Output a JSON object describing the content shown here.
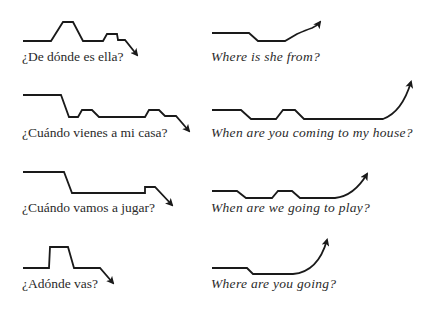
{
  "colors": {
    "line": "#1a1a1a",
    "text": "#2a2a2a",
    "background": "#ffffff"
  },
  "pairs": [
    {
      "spanish": {
        "text": "¿De dónde es ella?",
        "contour": "23,41 51,41 63,22 73,22 83,41 103,41 107,34 117,34 118,40 125,40",
        "arrow_end": "137,55",
        "arrow_dir": "down"
      },
      "english": {
        "text": "Where is she from?",
        "contour": "212,33 249,33 258,41 285,41 297,34 312,28",
        "arrow_end": "320,22",
        "arrow_dir": "up"
      }
    },
    {
      "spanish": {
        "text": "¿Cuándo vienes a mi casa?",
        "contour": "23,95 61,95 69,117 78,117 82,110 92,110 99,117 145,117 149,110 159,110 165,116 176,116",
        "arrow_end": "189,131",
        "arrow_dir": "down"
      },
      "english": {
        "text": "When are you coming to my house?",
        "contour": "212,110 241,110 251,119 276,119 283,110 295,110 304,119 383,119",
        "arrow_end": "411,82",
        "arrow_dir": "up"
      }
    },
    {
      "spanish": {
        "text": "¿Cuándo vamos a jugar?",
        "contour": "23,172 64,172 72,193 145,193 145,187 155,187",
        "arrow_end": "172,205",
        "arrow_dir": "down"
      },
      "english": {
        "text": "When are we going to play?",
        "contour": "212,191 237,191 246,198 272,198 278,191 292,191 300,198 335,198",
        "arrow_end": "367,174",
        "arrow_dir": "up"
      }
    },
    {
      "spanish": {
        "text": "¿Adónde vas?",
        "contour": "23,268 49,268 50,247 68,247 74,268 100,268",
        "arrow_end": "113,283",
        "arrow_dir": "down"
      },
      "english": {
        "text": "Where are you going?",
        "contour": "212,268 247,268 253,274 293,274",
        "arrow_end": "327,240",
        "arrow_dir": "up"
      }
    }
  ]
}
